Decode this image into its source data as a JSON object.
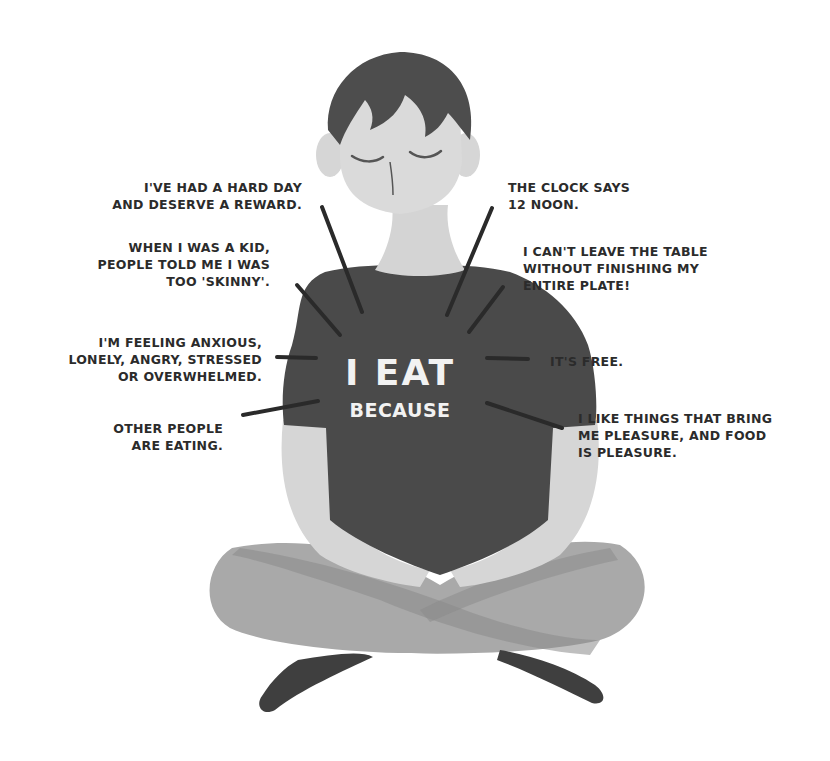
{
  "infographic": {
    "shirt_text": {
      "title": "I EAT",
      "subtitle": "BECAUSE"
    },
    "reasons_left": [
      {
        "id": "hard-day",
        "text": "I'VE HAD A HARD DAY\nAND DESERVE A REWARD."
      },
      {
        "id": "skinny",
        "text": "WHEN I WAS A KID,\nPEOPLE TOLD ME I WAS\nTOO 'SKINNY'."
      },
      {
        "id": "emotions",
        "text": "I'M FEELING ANXIOUS,\nLONELY, ANGRY, STRESSED\nOR OVERWHELMED."
      },
      {
        "id": "others-eating",
        "text": "OTHER PEOPLE\nARE EATING."
      }
    ],
    "reasons_right": [
      {
        "id": "clock",
        "text": "THE CLOCK SAYS\n12 NOON."
      },
      {
        "id": "finish-plate",
        "text": "I CAN'T LEAVE THE TABLE\nWITHOUT FINISHING MY\nENTIRE PLATE!"
      },
      {
        "id": "free",
        "text": "IT'S FREE."
      },
      {
        "id": "pleasure",
        "text": "I LIKE THINGS THAT BRING\nME PLEASURE, AND FOOD\nIS PLEASURE."
      }
    ],
    "colors": {
      "background": "#ffffff",
      "text": "#2b2b2b",
      "shirt": "#4a4a4a",
      "skin": "#d9d9d9",
      "hair": "#4d4d4d",
      "pants": "#a6a6a6",
      "pants_shadow": "#7d7d7d",
      "socks": "#3f3f3f",
      "connector": "#2a2a2a"
    }
  }
}
